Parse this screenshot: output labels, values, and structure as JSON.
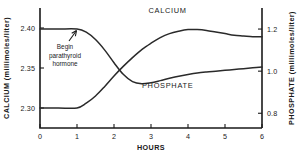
{
  "chart_data": {
    "type": "line",
    "title": "",
    "xlabel": "HOURS",
    "ylabel": "CALCIUM (millimoles/liter)",
    "y2label": "PHOSPHATE (millimoles/liter)",
    "xlim": [
      0,
      6
    ],
    "xticks": [
      "0",
      "1",
      "2",
      "3",
      "4",
      "5",
      "6"
    ],
    "ylim": [
      2.275,
      2.425
    ],
    "yticks": [
      "2.40",
      "2.35",
      "2.30"
    ],
    "y2lim": [
      0.73,
      1.3
    ],
    "y2ticks": [
      "1.2",
      "1.0",
      "0.8"
    ],
    "grid": false,
    "legend_position": "inline-labels",
    "annotations": [
      {
        "name": "begin-parathyroid-hormone",
        "lines": [
          "Begin",
          "parathyroid",
          "hormone"
        ],
        "x": 1.0
      }
    ],
    "series": [
      {
        "name": "CALCIUM",
        "label": "CALCIUM",
        "axis": "left",
        "color": "#2a2a2a",
        "x": [
          0,
          0.5,
          1.0,
          1.25,
          1.5,
          1.75,
          2.0,
          2.25,
          2.5,
          2.75,
          3.0,
          3.25,
          3.5,
          3.75,
          4.0,
          4.25,
          4.5,
          4.75,
          5.0,
          5.25,
          5.5,
          5.75,
          6.0
        ],
        "values": [
          2.3,
          2.3,
          2.3,
          2.306,
          2.315,
          2.327,
          2.34,
          2.352,
          2.363,
          2.373,
          2.381,
          2.388,
          2.393,
          2.396,
          2.398,
          2.398,
          2.397,
          2.395,
          2.393,
          2.391,
          2.39,
          2.389,
          2.389
        ]
      },
      {
        "name": "PHOSPHATE",
        "label": "PHOSPHATE",
        "axis": "right",
        "color": "#2a2a2a",
        "x": [
          0,
          0.5,
          1.0,
          1.25,
          1.5,
          1.75,
          2.0,
          2.25,
          2.5,
          2.75,
          3.0,
          3.25,
          3.5,
          3.75,
          4.0,
          4.25,
          4.5,
          4.75,
          5.0,
          5.25,
          5.5,
          5.75,
          6.0
        ],
        "values": [
          1.2,
          1.2,
          1.2,
          1.185,
          1.15,
          1.1,
          1.04,
          0.985,
          0.95,
          0.94,
          0.945,
          0.955,
          0.966,
          0.976,
          0.984,
          0.991,
          0.996,
          1.0,
          1.004,
          1.008,
          1.012,
          1.016,
          1.02
        ]
      }
    ],
    "series_label_positions": [
      {
        "name": "CALCIUM",
        "x": 3.45,
        "y_px": 13
      },
      {
        "name": "PHOSPHATE",
        "x": 3.45,
        "y_px": 88
      }
    ]
  }
}
